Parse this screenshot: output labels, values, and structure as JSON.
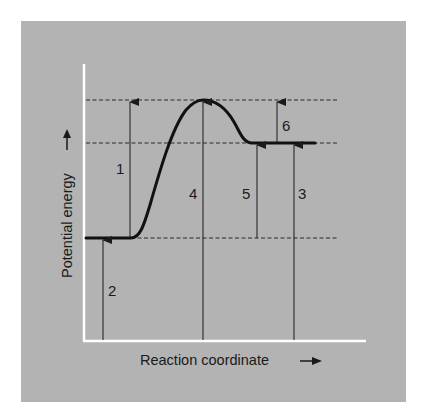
{
  "figure": {
    "background_color": "#b3b3b3",
    "axis_color": "#ffffff",
    "curve_color": "#111111",
    "y_axis_label": "Potential energy",
    "x_axis_label": "Reaction coordinate",
    "y_axis_arrow": "arrow-up-icon",
    "x_axis_arrow": "arrow-right-icon"
  },
  "levels": {
    "transition_state": "top dashed line (peak energy)",
    "products": "middle dashed line (product energy)",
    "reactants": "bottom dashed line (reactant energy)"
  },
  "arrows": [
    {
      "id": "1",
      "label": "1",
      "from": "reactants",
      "to": "transition_state"
    },
    {
      "id": "2",
      "label": "2",
      "from": "x-axis",
      "to": "reactants"
    },
    {
      "id": "3",
      "label": "3",
      "from": "x-axis",
      "to": "products"
    },
    {
      "id": "4",
      "label": "4",
      "from": "x-axis",
      "to": "transition_state"
    },
    {
      "id": "5",
      "label": "5",
      "from": "reactants",
      "to": "products"
    },
    {
      "id": "6",
      "label": "6",
      "from": "products",
      "to": "transition_state"
    }
  ]
}
